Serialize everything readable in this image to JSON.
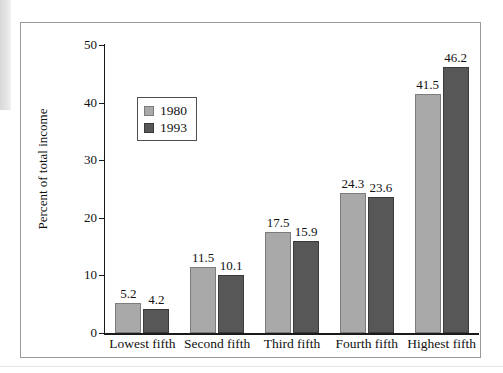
{
  "figure": {
    "frame_border_color": "#9a9a9a"
  },
  "chart_data": {
    "type": "bar",
    "title": "",
    "xlabel": "",
    "ylabel": "Percent of total income",
    "categories": [
      "Lowest fifth",
      "Second fifth",
      "Third fifth",
      "Fourth fifth",
      "Highest fifth"
    ],
    "series": [
      {
        "name": "1980",
        "color": "#a9a9a9",
        "values": [
          5.2,
          11.5,
          17.5,
          24.3,
          41.5
        ]
      },
      {
        "name": "1993",
        "color": "#575757",
        "values": [
          4.2,
          10.1,
          15.9,
          23.6,
          46.2
        ]
      }
    ],
    "value_labels": [
      [
        "5.2",
        "11.5",
        "17.5",
        "24.3",
        "41.5"
      ],
      [
        "4.2",
        "10.1",
        "15.9",
        "23.6",
        "46.2"
      ]
    ],
    "ylim": [
      0,
      50
    ],
    "yticks": [
      0,
      10,
      20,
      30,
      40,
      50
    ],
    "ytick_labels": [
      "0",
      "10",
      "20",
      "30",
      "40",
      "50"
    ],
    "grid": false,
    "legend_position": "upper left"
  },
  "axis": {
    "y_title": "Percent of total income",
    "y_ticks": [
      "0",
      "10",
      "20",
      "30",
      "40",
      "50"
    ],
    "x_ticks": [
      "Lowest fifth",
      "Second fifth",
      "Third fifth",
      "Fourth fifth",
      "Highest fifth"
    ]
  },
  "legend": {
    "entries": [
      {
        "label": "1980"
      },
      {
        "label": "1993"
      }
    ]
  },
  "bar_labels": {
    "g0s0": "5.2",
    "g0s1": "4.2",
    "g1s0": "11.5",
    "g1s1": "10.1",
    "g2s0": "17.5",
    "g2s1": "15.9",
    "g3s0": "24.3",
    "g3s1": "23.6",
    "g4s0": "41.5",
    "g4s1": "46.2"
  }
}
